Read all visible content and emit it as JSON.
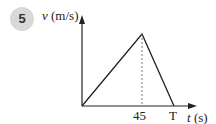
{
  "problem_number": "5",
  "diagram": {
    "y_axis_label": "v (m/s)",
    "x_axis_label": "t (s)",
    "x_tick_labels": [
      "45",
      "T"
    ],
    "shape": "triangle velocity-time graph",
    "points": [
      {
        "t": "0",
        "v": "0"
      },
      {
        "t": "45",
        "v": "peak"
      },
      {
        "t": "T",
        "v": "0"
      }
    ],
    "dashed_line_at": "45"
  }
}
